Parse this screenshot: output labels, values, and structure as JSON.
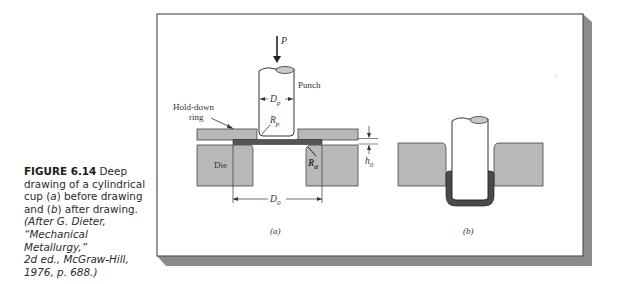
{
  "figure": {
    "number": "FIGURE 6.14",
    "caption_main": "Deep drawing of a cylindrical cup (a) before drawing and (b) after drawing.",
    "caption_lines": [
      {
        "parts": [
          {
            "t": "FIGURE 6.14",
            "style": "bold"
          },
          {
            "t": " Deep",
            "style": "normal"
          }
        ]
      },
      {
        "parts": [
          {
            "t": "drawing of a cylindrical",
            "style": "normal"
          }
        ]
      },
      {
        "parts": [
          {
            "t": "cup (",
            "style": "normal"
          },
          {
            "t": "a",
            "style": "italic"
          },
          {
            "t": ") before drawing",
            "style": "normal"
          }
        ]
      },
      {
        "parts": [
          {
            "t": "and (",
            "style": "normal"
          },
          {
            "t": "b",
            "style": "italic"
          },
          {
            "t": ") after drawing.",
            "style": "normal"
          }
        ]
      },
      {
        "parts": [
          {
            "t": "(After G. Dieter,",
            "style": "italic"
          }
        ]
      },
      {
        "parts": [
          {
            "t": "“Mechanical Metallurgy,”",
            "style": "italic"
          }
        ]
      },
      {
        "parts": [
          {
            "t": "2d ed., McGraw-Hill,",
            "style": "italic"
          }
        ]
      },
      {
        "parts": [
          {
            "t": "1976, p. 688.)",
            "style": "italic"
          }
        ]
      }
    ]
  },
  "diagram": {
    "labels": {
      "load": "P",
      "punch": "Punch",
      "punch_diameter": "D",
      "punch_diameter_sub": "p",
      "hold_down_1": "Hold-down",
      "hold_down_2": "ring",
      "punch_radius": "R",
      "punch_radius_sub": "p",
      "die": "Die",
      "die_radius": "R",
      "die_radius_sub": "d",
      "blank_thickness": "h",
      "blank_thickness_sub": "0",
      "blank_diameter": "D",
      "blank_diameter_sub": "0",
      "panel_a": "(a)",
      "panel_b": "(b)"
    },
    "colors": {
      "die_fill": "#b8b8b8",
      "blank_fill": "#555555",
      "frame_shadow": "#8a8a8a",
      "line": "#333333"
    }
  }
}
